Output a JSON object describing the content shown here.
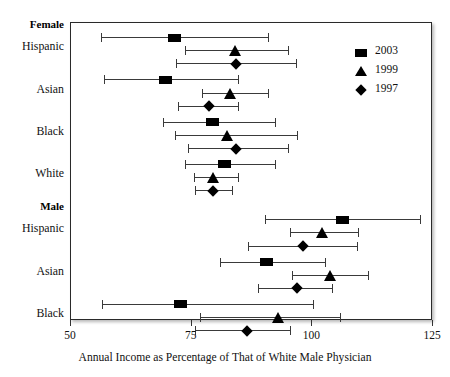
{
  "chart_data": {
    "type": "scatter",
    "title": "",
    "xlabel": "Annual Income as Percentage of That of White Male Physician",
    "ylabel": "",
    "xlim": [
      50,
      125
    ],
    "xticks": [
      50,
      75,
      100,
      125
    ],
    "xticklabels": [
      "50",
      "75",
      "100",
      "125"
    ],
    "grid": false,
    "legend_position": "top-right",
    "legend": [
      {
        "label": "2003",
        "marker": "square"
      },
      {
        "label": "1999",
        "marker": "triangle"
      },
      {
        "label": "1997",
        "marker": "diamond"
      }
    ],
    "groups": [
      {
        "name": "Female",
        "categories": [
          {
            "label": "Hispanic",
            "points": [
              {
                "series": "2003",
                "marker": "square",
                "value": 71.7,
                "ci_low": 56.4,
                "ci_high": 91.0
              },
              {
                "series": "1999",
                "marker": "triangle",
                "value": 84.2,
                "ci_low": 73.8,
                "ci_high": 95.1
              },
              {
                "series": "1997",
                "marker": "diamond",
                "value": 84.4,
                "ci_low": 71.9,
                "ci_high": 96.8
              }
            ]
          },
          {
            "label": "Asian",
            "points": [
              {
                "series": "2003",
                "marker": "square",
                "value": 69.7,
                "ci_low": 57.0,
                "ci_high": 84.8
              },
              {
                "series": "1999",
                "marker": "triangle",
                "value": 83.1,
                "ci_low": 77.3,
                "ci_high": 91.0
              },
              {
                "series": "1997",
                "marker": "diamond",
                "value": 78.8,
                "ci_low": 72.4,
                "ci_high": 84.8
              }
            ]
          },
          {
            "label": "Black",
            "points": [
              {
                "series": "2003",
                "marker": "square",
                "value": 79.6,
                "ci_low": 69.3,
                "ci_high": 92.4
              },
              {
                "series": "1999",
                "marker": "triangle",
                "value": 82.5,
                "ci_low": 71.7,
                "ci_high": 97.0
              },
              {
                "series": "1997",
                "marker": "diamond",
                "value": 84.4,
                "ci_low": 74.4,
                "ci_high": 95.1
              }
            ]
          },
          {
            "label": "White",
            "points": [
              {
                "series": "2003",
                "marker": "square",
                "value": 82.1,
                "ci_low": 73.8,
                "ci_high": 92.4
              },
              {
                "series": "1999",
                "marker": "triangle",
                "value": 79.6,
                "ci_low": 75.7,
                "ci_high": 84.8
              },
              {
                "series": "1997",
                "marker": "diamond",
                "value": 79.6,
                "ci_low": 75.9,
                "ci_high": 83.6
              }
            ]
          }
        ]
      },
      {
        "name": "Male",
        "categories": [
          {
            "label": "Hispanic",
            "points": [
              {
                "series": "2003",
                "marker": "square",
                "value": 106.5,
                "ci_low": 90.4,
                "ci_high": 122.5
              },
              {
                "series": "1999",
                "marker": "triangle",
                "value": 102.2,
                "ci_low": 95.6,
                "ci_high": 109.6
              },
              {
                "series": "1997",
                "marker": "diamond",
                "value": 98.3,
                "ci_low": 86.9,
                "ci_high": 109.4
              }
            ]
          },
          {
            "label": "Asian",
            "points": [
              {
                "series": "2003",
                "marker": "square",
                "value": 90.8,
                "ci_low": 81.1,
                "ci_high": 102.8
              },
              {
                "series": "1999",
                "marker": "triangle",
                "value": 103.9,
                "ci_low": 96.0,
                "ci_high": 111.7
              },
              {
                "series": "1997",
                "marker": "diamond",
                "value": 97.0,
                "ci_low": 88.9,
                "ci_high": 104.2
              }
            ]
          },
          {
            "label": "Black",
            "points": [
              {
                "series": "2003",
                "marker": "square",
                "value": 72.8,
                "ci_low": 56.6,
                "ci_high": 100.3
              },
              {
                "series": "1999",
                "marker": "triangle",
                "value": 93.1,
                "ci_low": 76.9,
                "ci_high": 105.9
              },
              {
                "series": "1997",
                "marker": "diamond",
                "value": 86.7,
                "ci_low": 75.9,
                "ci_high": 95.5
              }
            ]
          }
        ]
      }
    ]
  }
}
